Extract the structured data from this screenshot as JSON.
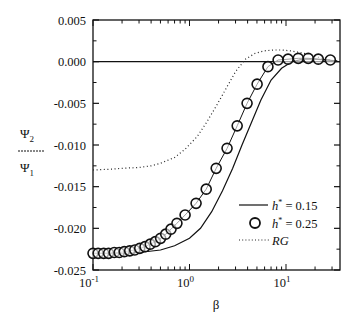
{
  "chart_data": {
    "type": "line",
    "title": "",
    "xlabel": "β",
    "ylabel": {
      "numerator": "Ψ",
      "numerator_sub": "2",
      "denominator": "Ψ",
      "denominator_sub": "1"
    },
    "xscale": "log",
    "xlim": [
      0.1,
      36
    ],
    "ylim": [
      -0.025,
      0.005
    ],
    "xticks": [
      {
        "base": "10",
        "exp": "-1",
        "value": 0.1
      },
      {
        "base": "10",
        "exp": "0",
        "value": 1
      },
      {
        "base": "10",
        "exp": "1",
        "value": 10
      }
    ],
    "yticks": [
      "0.005",
      "0.000",
      "-0.005",
      "-0.010",
      "-0.015",
      "-0.020",
      "-0.025"
    ],
    "ytick_values": [
      0.005,
      0.0,
      -0.005,
      -0.01,
      -0.015,
      -0.02,
      -0.025
    ],
    "grid": false,
    "legend_position": "lower right inside",
    "reference_line": {
      "y": 0.0,
      "style": "solid"
    },
    "series": [
      {
        "name": "h* = 0.15",
        "legend_label": {
          "var": "h",
          "sup": "*",
          "rest": " = 0.15"
        },
        "style": "solid line",
        "x": [
          0.1,
          0.2,
          0.3,
          0.5,
          0.7,
          1.0,
          1.3,
          1.7,
          2.2,
          2.8,
          3.5,
          4.5,
          5.5,
          7.0,
          9.0,
          11.5,
          15,
          20,
          26,
          34
        ],
        "y": [
          -0.023,
          -0.023,
          -0.0229,
          -0.0226,
          -0.0221,
          -0.0212,
          -0.02,
          -0.018,
          -0.0155,
          -0.0128,
          -0.01,
          -0.007,
          -0.0046,
          -0.0022,
          -0.0008,
          0.0,
          0.0003,
          0.0003,
          0.0002,
          0.0001
        ]
      },
      {
        "name": "h* = 0.25",
        "legend_label": {
          "var": "h",
          "sup": "*",
          "rest": " = 0.25"
        },
        "style": "open circles",
        "x": [
          0.1,
          0.113,
          0.129,
          0.145,
          0.166,
          0.187,
          0.211,
          0.24,
          0.271,
          0.305,
          0.346,
          0.392,
          0.443,
          0.502,
          0.567,
          0.643,
          0.741,
          0.9,
          1.17,
          1.49,
          1.89,
          2.45,
          3.12,
          3.95,
          5.02,
          6.5,
          8.28,
          10.5,
          13.4,
          17.0,
          21.6,
          28.8
        ],
        "y": [
          -0.023,
          -0.023,
          -0.023,
          -0.023,
          -0.0229,
          -0.0229,
          -0.0228,
          -0.0227,
          -0.0226,
          -0.0224,
          -0.0222,
          -0.0219,
          -0.0216,
          -0.0212,
          -0.0207,
          -0.0201,
          -0.0194,
          -0.0184,
          -0.017,
          -0.0153,
          -0.0128,
          -0.0104,
          -0.0077,
          -0.005,
          -0.0027,
          -0.0006,
          0.0002,
          0.0003,
          0.0004,
          0.0004,
          0.0003,
          0.0002
        ]
      },
      {
        "name": "RG",
        "legend_label": {
          "var": "RG",
          "sup": "",
          "rest": ""
        },
        "style": "dotted line",
        "x": [
          0.1,
          0.15,
          0.2,
          0.3,
          0.4,
          0.5,
          0.7,
          0.9,
          1.2,
          1.5,
          1.9,
          2.4,
          3.0,
          3.8,
          4.8,
          6.0,
          7.5,
          9.0,
          11,
          14,
          18,
          22,
          28,
          34
        ],
        "y": [
          -0.013,
          -0.0129,
          -0.0128,
          -0.0127,
          -0.0125,
          -0.0122,
          -0.0115,
          -0.0105,
          -0.009,
          -0.0073,
          -0.0053,
          -0.0032,
          -0.0012,
          0.0003,
          0.001,
          0.0013,
          0.0014,
          0.0014,
          0.0013,
          0.0011,
          0.0008,
          0.0005,
          0.0002,
          0.0
        ]
      }
    ]
  }
}
